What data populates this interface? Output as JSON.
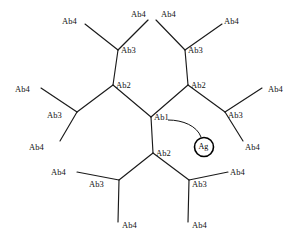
{
  "diagram": {
    "background_color": "#ffffff",
    "line_color": "#1a1a1a",
    "antigen": {
      "label": "Ag",
      "name": "antigen-node",
      "cx": 204,
      "cy": 147,
      "r": 9.5
    },
    "arrow": {
      "name": "antigen-pointer-arrow",
      "path": "M 168 120 C 183 120 197 126 201 137"
    },
    "nodes": [
      {
        "id": "ab1",
        "label": "Ab1",
        "x": 151,
        "y": 117,
        "lx": 154,
        "ly": 113
      },
      {
        "id": "ab2-ul",
        "label": "Ab2",
        "x": 113,
        "y": 85,
        "lx": 116,
        "ly": 81
      },
      {
        "id": "ab2-ur",
        "label": "Ab2",
        "x": 188,
        "y": 85,
        "lx": 191,
        "ly": 81
      },
      {
        "id": "ab2-b",
        "label": "Ab2",
        "x": 153,
        "y": 153,
        "lx": 156,
        "ly": 149
      },
      {
        "id": "ab3-tl",
        "label": "Ab3",
        "x": 118,
        "y": 50,
        "lx": 121,
        "ly": 46
      },
      {
        "id": "ab3-tr",
        "label": "Ab3",
        "x": 185,
        "y": 50,
        "lx": 188,
        "ly": 46
      },
      {
        "id": "ab3-l",
        "label": "Ab3",
        "x": 77,
        "y": 112,
        "lx": 47,
        "ly": 111
      },
      {
        "id": "ab3-r",
        "label": "Ab3",
        "x": 225,
        "y": 112,
        "lx": 228,
        "ly": 111
      },
      {
        "id": "ab3-bl",
        "label": "Ab3",
        "x": 119,
        "y": 180,
        "lx": 89,
        "ly": 180
      },
      {
        "id": "ab3-br",
        "label": "Ab3",
        "x": 189,
        "y": 180,
        "lx": 192,
        "ly": 180
      }
    ],
    "leaves": [
      {
        "id": "ab4-1",
        "label": "Ab4",
        "x": 85,
        "y": 24,
        "lx": 62,
        "ly": 17
      },
      {
        "id": "ab4-2",
        "label": "Ab4",
        "x": 148,
        "y": 20,
        "lx": 131,
        "ly": 10
      },
      {
        "id": "ab4-3",
        "label": "Ab4",
        "x": 156,
        "y": 20,
        "lx": 161,
        "ly": 10
      },
      {
        "id": "ab4-4",
        "label": "Ab4",
        "x": 222,
        "y": 24,
        "lx": 224,
        "ly": 17
      },
      {
        "id": "ab4-5",
        "label": "Ab4",
        "x": 41,
        "y": 88,
        "lx": 15,
        "ly": 85
      },
      {
        "id": "ab4-6",
        "label": "Ab4",
        "x": 60,
        "y": 141,
        "lx": 29,
        "ly": 143
      },
      {
        "id": "ab4-7",
        "label": "Ab4",
        "x": 262,
        "y": 88,
        "lx": 268,
        "ly": 85
      },
      {
        "id": "ab4-8",
        "label": "Ab4",
        "x": 243,
        "y": 141,
        "lx": 245,
        "ly": 143
      },
      {
        "id": "ab4-9",
        "label": "Ab4",
        "x": 77,
        "y": 172,
        "lx": 51,
        "ly": 168
      },
      {
        "id": "ab4-10",
        "label": "Ab4",
        "x": 118,
        "y": 222,
        "lx": 122,
        "ly": 221
      },
      {
        "id": "ab4-11",
        "label": "Ab4",
        "x": 228,
        "y": 172,
        "lx": 230,
        "ly": 168
      },
      {
        "id": "ab4-12",
        "label": "Ab4",
        "x": 188,
        "y": 222,
        "lx": 192,
        "ly": 221
      }
    ],
    "edges": [
      {
        "name": "edge-ab1-ab2-upper-left",
        "x1": 151,
        "y1": 117,
        "x2": 113,
        "y2": 85
      },
      {
        "name": "edge-ab1-ab2-upper-right",
        "x1": 151,
        "y1": 117,
        "x2": 188,
        "y2": 85
      },
      {
        "name": "edge-ab1-ab2-bottom",
        "x1": 151,
        "y1": 117,
        "x2": 153,
        "y2": 153
      },
      {
        "name": "edge-ab2ul-ab3-top-left",
        "x1": 113,
        "y1": 85,
        "x2": 118,
        "y2": 50
      },
      {
        "name": "edge-ab2ul-ab3-left",
        "x1": 113,
        "y1": 85,
        "x2": 77,
        "y2": 112
      },
      {
        "name": "edge-ab2ur-ab3-top-right",
        "x1": 188,
        "y1": 85,
        "x2": 185,
        "y2": 50
      },
      {
        "name": "edge-ab2ur-ab3-right",
        "x1": 188,
        "y1": 85,
        "x2": 225,
        "y2": 112
      },
      {
        "name": "edge-ab2b-ab3-bottom-left",
        "x1": 153,
        "y1": 153,
        "x2": 119,
        "y2": 180
      },
      {
        "name": "edge-ab2b-ab3-bottom-right",
        "x1": 153,
        "y1": 153,
        "x2": 189,
        "y2": 180
      },
      {
        "name": "edge-ab3tl-ab4-1",
        "x1": 118,
        "y1": 50,
        "x2": 85,
        "y2": 24
      },
      {
        "name": "edge-ab3tl-ab4-2",
        "x1": 118,
        "y1": 50,
        "x2": 148,
        "y2": 20
      },
      {
        "name": "edge-ab3tr-ab4-3",
        "x1": 185,
        "y1": 50,
        "x2": 156,
        "y2": 20
      },
      {
        "name": "edge-ab3tr-ab4-4",
        "x1": 185,
        "y1": 50,
        "x2": 222,
        "y2": 24
      },
      {
        "name": "edge-ab3l-ab4-5",
        "x1": 77,
        "y1": 112,
        "x2": 41,
        "y2": 88
      },
      {
        "name": "edge-ab3l-ab4-6",
        "x1": 77,
        "y1": 112,
        "x2": 60,
        "y2": 141
      },
      {
        "name": "edge-ab3r-ab4-7",
        "x1": 225,
        "y1": 112,
        "x2": 262,
        "y2": 88
      },
      {
        "name": "edge-ab3r-ab4-8",
        "x1": 225,
        "y1": 112,
        "x2": 243,
        "y2": 141
      },
      {
        "name": "edge-ab3bl-ab4-9",
        "x1": 119,
        "y1": 180,
        "x2": 77,
        "y2": 172
      },
      {
        "name": "edge-ab3bl-ab4-10",
        "x1": 119,
        "y1": 180,
        "x2": 118,
        "y2": 222
      },
      {
        "name": "edge-ab3br-ab4-11",
        "x1": 189,
        "y1": 180,
        "x2": 228,
        "y2": 172
      },
      {
        "name": "edge-ab3br-ab4-12",
        "x1": 189,
        "y1": 180,
        "x2": 188,
        "y2": 222
      }
    ]
  }
}
